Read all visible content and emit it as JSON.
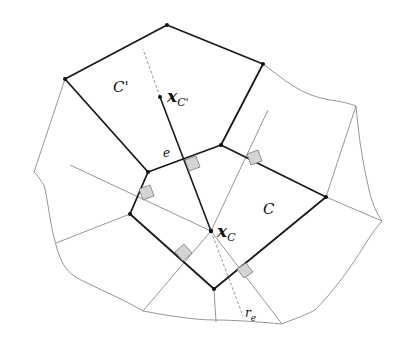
{
  "diagram": {
    "type": "voronoi-mesh-cells",
    "colors": {
      "cell_edge": "#1a1a1a",
      "mesh_line": "#8a8a8a",
      "right_angle_fill": "#d4d4d4",
      "right_angle_stroke": "#777777"
    },
    "labels": {
      "cell_c_prime": "C'",
      "cell_c": "C",
      "x_c_prime_main": "x",
      "x_c_prime_sub": "C'",
      "x_c_main": "x",
      "x_c_sub": "C",
      "edge_e": "e",
      "ray_main": "r",
      "ray_sub": "e"
    },
    "points": {
      "x_c_prime": [
        160,
        97
      ],
      "x_c": [
        211,
        231
      ]
    }
  }
}
